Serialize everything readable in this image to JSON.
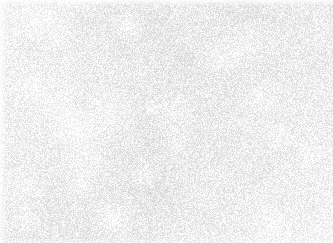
{
  "image": {
    "kind": "histology-micrograph",
    "title": "Histopathology micrograph",
    "description": "Grayscale high-power field of a small round blue cell proliferation; densely packed hyperchromatic nuclei with scant cytoplasm on a pale eosinophilic background.",
    "width": 333,
    "height": 243,
    "color_mode": "grayscale",
    "stain": "hematoxylin-eosin (desaturated)",
    "has_text_overlay": false,
    "has_scale_bar": false,
    "has_border_frame": false
  },
  "palette": {
    "background_light": "#f7f5f3",
    "background_mid": "#ece9e6",
    "stroma_wash": "#d9d6d3",
    "nucleus_dark": "#2b2b2b",
    "nucleus_mid": "#4a4a4a",
    "nucleus_light": "#6e6e6e",
    "highlight": "#fdfdfc",
    "edge_margin": "#ffffff"
  },
  "render": {
    "seed": 20250411,
    "nucleus_count": 1350,
    "nucleus_radius_min": 2.6,
    "nucleus_radius_max": 5.2,
    "nucleus_blur_px": 0.85,
    "nucleus_opacity_min": 0.55,
    "nucleus_opacity_max": 0.97,
    "stroma_blob_count": 95,
    "stroma_radius_min": 9,
    "stroma_radius_max": 34,
    "grain_amount": 0.16,
    "global_blur_px": 0.45
  },
  "density_field": {
    "description": "Normalized cellularity weights sampled on a 6 x 5 grid (columns left to right, rows top to bottom). 1.0 = most confluent.",
    "cols": 6,
    "rows": 5,
    "weights": [
      [
        0.62,
        0.74,
        0.7,
        0.78,
        0.95,
        1.0
      ],
      [
        0.58,
        0.7,
        0.66,
        0.74,
        0.92,
        0.97
      ],
      [
        0.34,
        0.48,
        0.72,
        0.8,
        0.86,
        0.9
      ],
      [
        0.26,
        0.4,
        0.68,
        0.82,
        0.78,
        0.84
      ],
      [
        0.3,
        0.52,
        0.74,
        0.7,
        0.72,
        0.8
      ]
    ]
  },
  "regions": [
    {
      "name": "top-right-confluent-sheet",
      "x": 222,
      "y": 0,
      "width": 111,
      "height": 95,
      "cellularity": "very high",
      "mean_tone": "#6b6b6b",
      "note": "Nuclei nearly back-to-back, overlapping; darkest field in the image."
    },
    {
      "name": "top-left-moderate",
      "x": 0,
      "y": 0,
      "width": 111,
      "height": 81,
      "cellularity": "moderate",
      "mean_tone": "#9a9a9a",
      "note": "Clustered nuclei separated by pale interstitial spaces."
    },
    {
      "name": "upper-center",
      "x": 111,
      "y": 0,
      "width": 111,
      "height": 81,
      "cellularity": "moderate-high",
      "mean_tone": "#8d8d8d",
      "note": "Mixed clusters with a pale clearing toward the middle."
    },
    {
      "name": "left-mid-pale-clearing",
      "x": 0,
      "y": 95,
      "width": 95,
      "height": 90,
      "cellularity": "low",
      "mean_tone": "#e2e0dd",
      "note": "Sparse, washed-out zone with scattered single nuclei."
    },
    {
      "name": "center-field",
      "x": 111,
      "y": 81,
      "width": 111,
      "height": 81,
      "cellularity": "high",
      "mean_tone": "#888888",
      "note": "Evenly dispersed round nuclei of uniform caliber."
    },
    {
      "name": "right-mid",
      "x": 222,
      "y": 81,
      "width": 111,
      "height": 81,
      "cellularity": "high",
      "mean_tone": "#7d7d7d",
      "note": "Dense with irregular pale serpiginous channels."
    },
    {
      "name": "bottom-left-sparse",
      "x": 0,
      "y": 162,
      "width": 111,
      "height": 81,
      "cellularity": "low-moderate",
      "mean_tone": "#d2d0cd",
      "note": "Pale background, loosely scattered and small aggregates."
    },
    {
      "name": "bottom-center",
      "x": 111,
      "y": 162,
      "width": 111,
      "height": 81,
      "cellularity": "moderate-high",
      "mean_tone": "#939393",
      "note": "Short chains and doublets of nuclei."
    },
    {
      "name": "bottom-right",
      "x": 222,
      "y": 162,
      "width": 111,
      "height": 81,
      "cellularity": "high",
      "mean_tone": "#848484",
      "note": "Coarse dark clusters with intervening pale stroma."
    }
  ],
  "features": {
    "cell_type": "small round cells with high nuclear-to-cytoplasmic ratio",
    "nuclear_shape": "round to slightly ovoid",
    "chromatin": "hyperchromatic, coarsely granular",
    "mean_nucleus_diameter_px": 8,
    "background_texture": "finely granular pale matrix with out-of-focus haze"
  }
}
